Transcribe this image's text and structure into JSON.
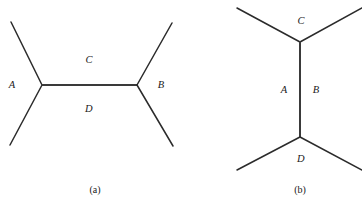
{
  "figure": {
    "background_color": "#ffffff",
    "line_color": "#2b2b2b",
    "width": 362,
    "height": 206
  },
  "panels": [
    {
      "id": "panel-a",
      "caption": "(a)",
      "caption_x": 95,
      "caption_y": 190,
      "orientation": "horizontal",
      "vertices": [
        {
          "name": "left-vertex",
          "x": 42,
          "y": 85
        },
        {
          "name": "right-vertex",
          "x": 137,
          "y": 85
        }
      ],
      "edges": [
        {
          "name": "upper-left-leg",
          "x1": 11,
          "y1": 22,
          "x2": 42,
          "y2": 85,
          "kind": "external"
        },
        {
          "name": "lower-left-leg",
          "x1": 10,
          "y1": 145,
          "x2": 42,
          "y2": 85,
          "kind": "external"
        },
        {
          "name": "internal-line",
          "x1": 42,
          "y1": 85,
          "x2": 137,
          "y2": 85,
          "kind": "internal"
        },
        {
          "name": "upper-right-leg",
          "x1": 137,
          "y1": 85,
          "x2": 172,
          "y2": 23,
          "kind": "external"
        },
        {
          "name": "lower-right-leg",
          "x1": 137,
          "y1": 85,
          "x2": 173,
          "y2": 146,
          "kind": "external"
        }
      ],
      "labels": [
        {
          "name": "label-a",
          "text": "A",
          "x": 12,
          "y": 85
        },
        {
          "name": "label-b",
          "text": "B",
          "x": 161,
          "y": 85
        },
        {
          "name": "label-c",
          "text": "C",
          "x": 89,
          "y": 60
        },
        {
          "name": "label-d",
          "text": "D",
          "x": 89,
          "y": 109
        }
      ]
    },
    {
      "id": "panel-b",
      "caption": "(b)",
      "caption_x": 300,
      "caption_y": 190,
      "orientation": "vertical",
      "vertices": [
        {
          "name": "top-vertex",
          "x": 300,
          "y": 42
        },
        {
          "name": "bottom-vertex",
          "x": 300,
          "y": 137
        }
      ],
      "edges": [
        {
          "name": "upper-left-leg",
          "x1": 237,
          "y1": 8,
          "x2": 300,
          "y2": 42,
          "kind": "external"
        },
        {
          "name": "upper-right-leg",
          "x1": 300,
          "y1": 42,
          "x2": 362,
          "y2": 8,
          "kind": "external"
        },
        {
          "name": "internal-line",
          "x1": 300,
          "y1": 42,
          "x2": 300,
          "y2": 137,
          "kind": "internal"
        },
        {
          "name": "lower-left-leg",
          "x1": 237,
          "y1": 170,
          "x2": 300,
          "y2": 137,
          "kind": "external"
        },
        {
          "name": "lower-right-leg",
          "x1": 300,
          "y1": 137,
          "x2": 362,
          "y2": 170,
          "kind": "external"
        }
      ],
      "labels": [
        {
          "name": "label-c",
          "text": "C",
          "x": 301,
          "y": 21
        },
        {
          "name": "label-a",
          "text": "A",
          "x": 284,
          "y": 90
        },
        {
          "name": "label-b",
          "text": "B",
          "x": 316,
          "y": 90
        },
        {
          "name": "label-d",
          "text": "D",
          "x": 301,
          "y": 159
        }
      ]
    }
  ]
}
